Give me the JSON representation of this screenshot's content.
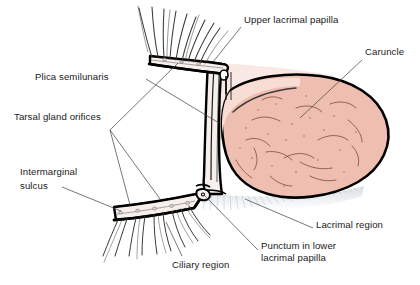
{
  "figure": {
    "background_color": "#ffffff",
    "line_color": "#000000",
    "leader_color": "#4a4a4a",
    "caruncle_fill": "#eebfb1",
    "caruncle_highlight": "#f7ddd4",
    "conjunctiva_fill": "#f9e9e4",
    "lid_margin_fill": "#f6efec",
    "orifice_color": "#8a7d78",
    "lash_color": "#3a3a33",
    "vessel_color": "#7a4a40"
  },
  "labels": [
    {
      "id": "upper-lacrimal-papilla",
      "text": "Upper lacrimal papilla",
      "lines": [
        "Upper lacrimal papilla"
      ],
      "x": 244,
      "y": 14,
      "align": "left"
    },
    {
      "id": "caruncle",
      "text": "Caruncle",
      "lines": [
        "Caruncle"
      ],
      "x": 365,
      "y": 46,
      "align": "left"
    },
    {
      "id": "plica-semilunaris",
      "text": "Plica semilunaris",
      "lines": [
        "Plica semilunaris"
      ],
      "x": 35,
      "y": 71,
      "align": "left"
    },
    {
      "id": "tarsal-gland-orifices",
      "text": "Tarsal gland orifices",
      "lines": [
        "Tarsal gland orifices"
      ],
      "x": 14,
      "y": 111,
      "align": "left"
    },
    {
      "id": "intermarginal-sulcus",
      "text": "Intermarginal sulcus",
      "lines": [
        "Intermarginal",
        "sulcus"
      ],
      "x": 20,
      "y": 166,
      "align": "left"
    },
    {
      "id": "lacrimal-region",
      "text": "Lacrimal region",
      "lines": [
        "Lacrimal region"
      ],
      "x": 316,
      "y": 219,
      "align": "left"
    },
    {
      "id": "punctum-lower-lacrimal-papilla",
      "text": "Punctum in lower lacrimal papilla",
      "lines": [
        "Punctum in lower",
        "lacrimal papilla"
      ],
      "x": 261,
      "y": 240,
      "align": "left"
    },
    {
      "id": "ciliary-region",
      "text": "Ciliary region",
      "lines": [
        "Ciliary region"
      ],
      "x": 172,
      "y": 259,
      "align": "left"
    }
  ],
  "leaders": [
    {
      "id": "leader-upper-lacrimal-papilla",
      "points": "241,27 213,62"
    },
    {
      "id": "leader-caruncle",
      "points": "362,60 300,118"
    },
    {
      "id": "leader-plica-semilunaris",
      "points": "146,79 219,123"
    },
    {
      "id": "leader-tarsal-upper",
      "points": "110,130 178,63"
    },
    {
      "id": "leader-tarsal-lower",
      "points": "110,130 130,205"
    },
    {
      "id": "leader-tarsal-mid",
      "points": "110,130 160,199"
    },
    {
      "id": "leader-intermarginal-sulcus",
      "points": "62,187 121,211"
    },
    {
      "id": "leader-lacrimal-region",
      "points": "313,228 245,199"
    },
    {
      "id": "leader-punctum",
      "points": "258,250 205,196"
    },
    {
      "id": "leader-ciliary-region",
      "points": "182,256 166,222"
    }
  ],
  "structures": [
    {
      "id": "caruncle-body",
      "name": "caruncle"
    },
    {
      "id": "plica-semilunaris-fold",
      "name": "plica semilunaris"
    },
    {
      "id": "upper-lid-margin",
      "name": "upper eyelid margin"
    },
    {
      "id": "lower-lid-margin",
      "name": "lower eyelid margin"
    },
    {
      "id": "upper-eyelashes",
      "name": "upper cilia"
    },
    {
      "id": "lower-eyelashes",
      "name": "lower cilia"
    },
    {
      "id": "upper-punctum-notch",
      "name": "upper lacrimal papilla notch"
    },
    {
      "id": "lower-punctum-notch",
      "name": "lower lacrimal papilla punctum"
    },
    {
      "id": "tarsal-gland-orifice-dots",
      "name": "tarsal gland orifices"
    },
    {
      "id": "lacrimal-lake-shading",
      "name": "lacrimal region shading"
    }
  ]
}
